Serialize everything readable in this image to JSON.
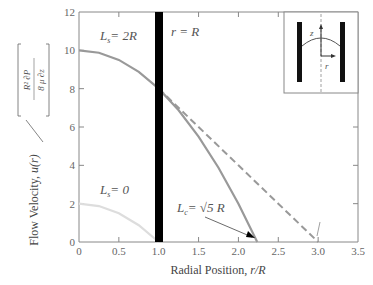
{
  "chart_data": {
    "type": "line",
    "title": "",
    "xlabel": "Radial Position, r/R",
    "ylabel": "Flow Velocity, u(r) / [ (R² / 8μ) ∂P/∂z ]",
    "xlim": [
      0,
      3.5
    ],
    "ylim": [
      0,
      12
    ],
    "xticks": [
      0,
      0.5,
      1.0,
      1.5,
      2.0,
      2.5,
      3.0,
      3.5
    ],
    "xtick_labels": [
      "0",
      "0.5",
      "1.0",
      "1.5",
      "2.0",
      "2.5",
      "3.0",
      "3.5"
    ],
    "yticks": [
      0,
      2,
      4,
      6,
      8,
      10,
      12
    ],
    "ytick_labels": [
      "0",
      "2",
      "4",
      "6",
      "8",
      "10",
      "12"
    ],
    "grid": false,
    "series": [
      {
        "name": "L_s = 2R",
        "style": "solid",
        "color": "#999999",
        "x": [
          0,
          0.25,
          0.5,
          0.75,
          1.0,
          1.25,
          1.5,
          1.75,
          2.0,
          2.236
        ],
        "y": [
          10,
          9.875,
          9.5,
          8.875,
          8.0,
          6.875,
          5.5,
          3.875,
          2.0,
          0
        ]
      },
      {
        "name": "Extrapolated (dashed)",
        "style": "dashed",
        "color": "#999999",
        "x": [
          1.0,
          1.5,
          2.0,
          2.5,
          3.0
        ],
        "y": [
          8.0,
          6.0,
          4.0,
          2.0,
          0
        ]
      },
      {
        "name": "L_s = 0",
        "style": "solid",
        "color": "#dddddd",
        "x": [
          0,
          0.25,
          0.5,
          0.75,
          1.0
        ],
        "y": [
          2.0,
          1.875,
          1.5,
          0.875,
          0
        ]
      }
    ],
    "wall": {
      "x": 1.0,
      "label": "r = R",
      "color": "#000000"
    },
    "annotations": [
      {
        "text": "L_s = 2R",
        "x": 0.3,
        "y": 11
      },
      {
        "text": "r = R",
        "x": 1.1,
        "y": 11.6
      },
      {
        "text": "L_s = 0",
        "x": 0.3,
        "y": 3.2
      },
      {
        "text": "L_c = √5 R",
        "x": 1.2,
        "y": 1.5,
        "arrow_to": [
          2.17,
          0.3
        ]
      },
      {
        "arrow_to_dashed": [
          3.0,
          0.2
        ]
      }
    ],
    "inset": {
      "description": "pipe cross-section with parabolic profile, axes z and r",
      "labels": [
        "z",
        "r"
      ]
    }
  },
  "labels": {
    "xlabel": "Radial Position, ",
    "xlabel_var": "r/R",
    "ylabel_main": "Flow Velocity, ",
    "ylabel_var": "u(r)",
    "ylabel_num": "R² ∂P",
    "ylabel_den": "8 μ  ∂z",
    "ann_ls2": "= 2R",
    "ann_ls0": "= 0",
    "ann_rR": "r = R",
    "ann_lc": "= √5 R",
    "inset_z": "z",
    "inset_r": "r"
  }
}
